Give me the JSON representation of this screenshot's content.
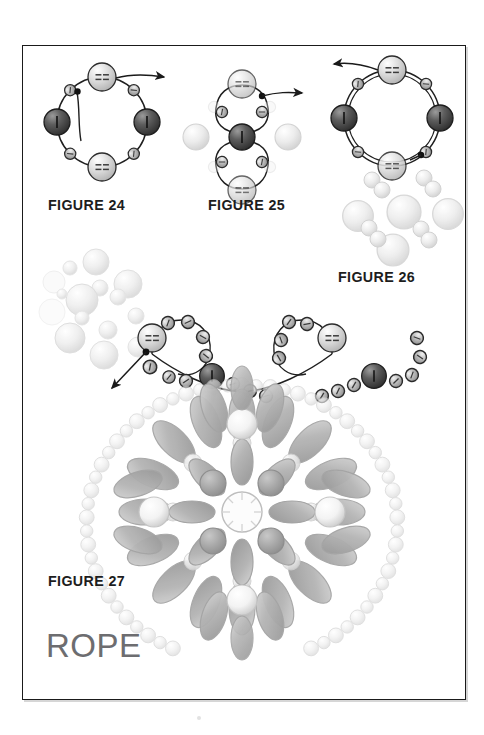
{
  "page": {
    "title": "ROPE",
    "width": 484,
    "height": 735,
    "background_color": "#ffffff",
    "frame_color": "#1a1a1a",
    "word_color": "#6d6d70",
    "label_color": "#1d1d1d"
  },
  "figures": [
    {
      "id": "figure-24",
      "label": "FIGURE 24",
      "x": 48,
      "y": 196,
      "description": "Closed ring of eight beads: two dark round beads at left and right, one light bi-cone at top with thread exiting right, one light bi-cone at bottom, four small seed beads between them; working thread tail hangs below top bead."
    },
    {
      "id": "figure-25",
      "label": "FIGURE 25",
      "x": 208,
      "y": 196,
      "description": "Vertical two-loop unit around a central dark bead with four small seed beads, a pale bi-cone above and below, two ghosted pearls at left and right, thread exits to the right."
    },
    {
      "id": "figure-26",
      "label": "FIGURE 26",
      "x": 338,
      "y": 268,
      "description": "Completed ring of eight beads with two dark round beads, two light bi-cones and four seed beads; thread exits upper left. Loose pearls shown scattered beneath."
    },
    {
      "id": "figure-27",
      "label": "FIGURE 27",
      "x": 48,
      "y": 572,
      "description": "Finished rope swag of dark and light beads draped above a large beaded rosette medallion with radiating petal beads, accent pearls and a seed-bead outer ring."
    }
  ],
  "colors": {
    "bead_dark": "#4a4a4a",
    "bead_mid": "#8e8e8e",
    "bead_light": "#cfcfcf",
    "bead_pearl": "#e8e8e8",
    "petal_fill": "#b9b9b9",
    "outline": "#2b2b2b",
    "ghost_outline": "#d2d2d2"
  },
  "annotations": {
    "thread_arrows": 3,
    "arrow_label_24": "thread direction out of top bead, pointing right",
    "arrow_label_25": "thread direction pointing right",
    "arrow_label_26": "thread direction pointing left",
    "arrow_label_27": "thread direction pointing down-left"
  }
}
